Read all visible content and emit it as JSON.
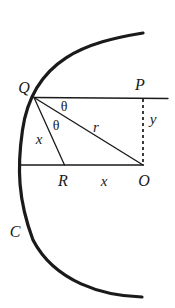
{
  "figure": {
    "kind": "geometry-diagram",
    "width": 175,
    "height": 308,
    "background_color": "#ffffff",
    "stroke_color": "#1a1a1a",
    "labels": {
      "curve": "C",
      "point_q": "Q",
      "point_p": "P",
      "point_o": "O",
      "point_r": "R",
      "angle_upper": "θ",
      "angle_lower": "θ",
      "segment_r": "r",
      "segment_x_diagonal": "x",
      "segment_x_base": "x",
      "segment_y": "y"
    },
    "label_positions": {
      "curve": {
        "x": 15,
        "y": 232
      },
      "point_q": {
        "x": 24,
        "y": 88
      },
      "point_p": {
        "x": 140,
        "y": 85
      },
      "point_o": {
        "x": 144,
        "y": 181
      },
      "point_r": {
        "x": 63,
        "y": 181
      },
      "angle_upper": {
        "x": 64,
        "y": 107
      },
      "angle_lower": {
        "x": 56,
        "y": 126
      },
      "segment_r": {
        "x": 96,
        "y": 127
      },
      "segment_x_diagonal": {
        "x": 39,
        "y": 139
      },
      "segment_x_base": {
        "x": 104,
        "y": 181
      },
      "segment_y": {
        "x": 153,
        "y": 119
      }
    },
    "geometry": {
      "arc_path": "M 143 33 C 88 42 33 58 22.5 130 C 17 168 18 200 33 240 C 55 282 103 296 142 297",
      "arc_stroke_width": 3.2,
      "line_stroke_width": 1.3,
      "dash_stroke_width": 1.6,
      "dash_pattern": "3,3",
      "vertices": {
        "Q": {
          "x": 34,
          "y": 97
        },
        "P": {
          "x": 143,
          "y": 98
        },
        "O": {
          "x": 143,
          "y": 165
        },
        "R": {
          "x": 64,
          "y": 165
        },
        "line_qp_end": {
          "x": 168,
          "y": 98
        },
        "line_base_start": {
          "x": 22,
          "y": 165
        }
      },
      "segments": [
        {
          "name": "line-qp",
          "x1": 34,
          "y1": 97,
          "x2": 168,
          "y2": 98,
          "style": "solid"
        },
        {
          "name": "line-qo",
          "x1": 34,
          "y1": 97,
          "x2": 143,
          "y2": 165,
          "style": "solid"
        },
        {
          "name": "line-qr",
          "x1": 34,
          "y1": 97,
          "x2": 64,
          "y2": 165,
          "style": "solid"
        },
        {
          "name": "line-base-ro",
          "x1": 22,
          "y1": 165,
          "x2": 143,
          "y2": 165,
          "style": "solid"
        },
        {
          "name": "line-po-dashed",
          "x1": 143,
          "y1": 99,
          "x2": 143,
          "y2": 165,
          "style": "dashed"
        }
      ]
    }
  }
}
